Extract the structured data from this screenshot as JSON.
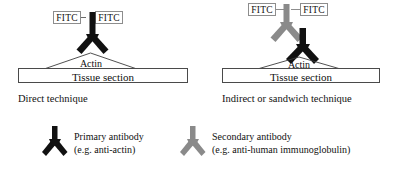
{
  "figure": {
    "title_visible": false,
    "background": "#ffffff",
    "colors": {
      "primary_antibody": "#111111",
      "secondary_antibody": "#8a8a8a",
      "box_border": "#4a4a4a",
      "tag_border": "#8d8d8d",
      "line": "#555555"
    }
  },
  "panels": [
    {
      "id": "direct",
      "caption": "Direct technique",
      "tags": [
        {
          "label": "FITC"
        },
        {
          "label": "FITC"
        }
      ],
      "substrate_label": "Tissue section",
      "target_label": "Actin",
      "antibodies": [
        {
          "type": "primary-antibody",
          "color": "#111111"
        }
      ]
    },
    {
      "id": "indirect",
      "caption": "Indirect or sandwich technique",
      "tags": [
        {
          "label": "FITC"
        },
        {
          "label": "FITC"
        }
      ],
      "substrate_label": "Tissue section",
      "target_label": "Actin",
      "antibodies": [
        {
          "type": "secondary-antibody",
          "color": "#8a8a8a"
        },
        {
          "type": "primary-antibody",
          "color": "#111111"
        }
      ]
    }
  ],
  "legend": {
    "items": [
      {
        "glyph": "primary-antibody",
        "color": "#111111",
        "line1": "Primary antibody",
        "line2": "(e.g. anti-actin)"
      },
      {
        "glyph": "secondary-antibody",
        "color": "#8a8a8a",
        "line1": "Secondary antibody",
        "line2": "(e.g. anti-human immunoglobulin)"
      }
    ]
  }
}
